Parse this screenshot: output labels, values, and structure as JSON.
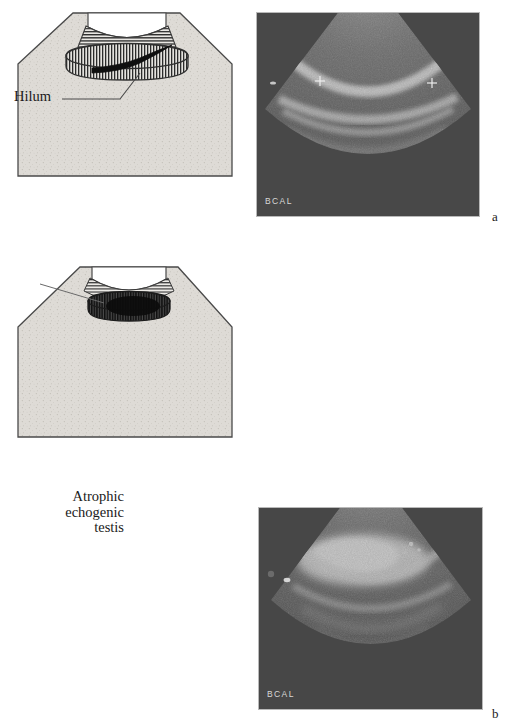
{
  "figure": {
    "type": "medical-ultrasound-figure",
    "panels": [
      {
        "letter": "a",
        "diagram": {
          "label": "Hilum",
          "structure": "normal testis with hilum",
          "testis_fill": "vertical-hatch",
          "band_fill": "horizontal-hatch"
        },
        "ultrasound": {
          "machine_text": "BCAL",
          "calipers": 2,
          "probe": "curvilinear"
        }
      },
      {
        "letter": "b",
        "diagram": {
          "label": "Atrophic\nechogenic\ntestis",
          "label_lines": [
            "Atrophic",
            "echogenic",
            "testis"
          ],
          "structure": "atrophic echogenic testis",
          "testis_fill": "dark-vertical-hatch",
          "band_fill": "horizontal-hatch"
        },
        "ultrasound": {
          "machine_text": "BCAL",
          "calipers": 0,
          "probe": "curvilinear"
        }
      }
    ]
  },
  "colors": {
    "page_background": "#ffffff",
    "body_fill": "#dedbd6",
    "outline": "#3a3a3a",
    "hilum_dark": "#121212",
    "ultrasound_background": "#4b4b4b",
    "ultrasound_border": "#b9b9b9",
    "caption_text": "#d8d8d8"
  }
}
